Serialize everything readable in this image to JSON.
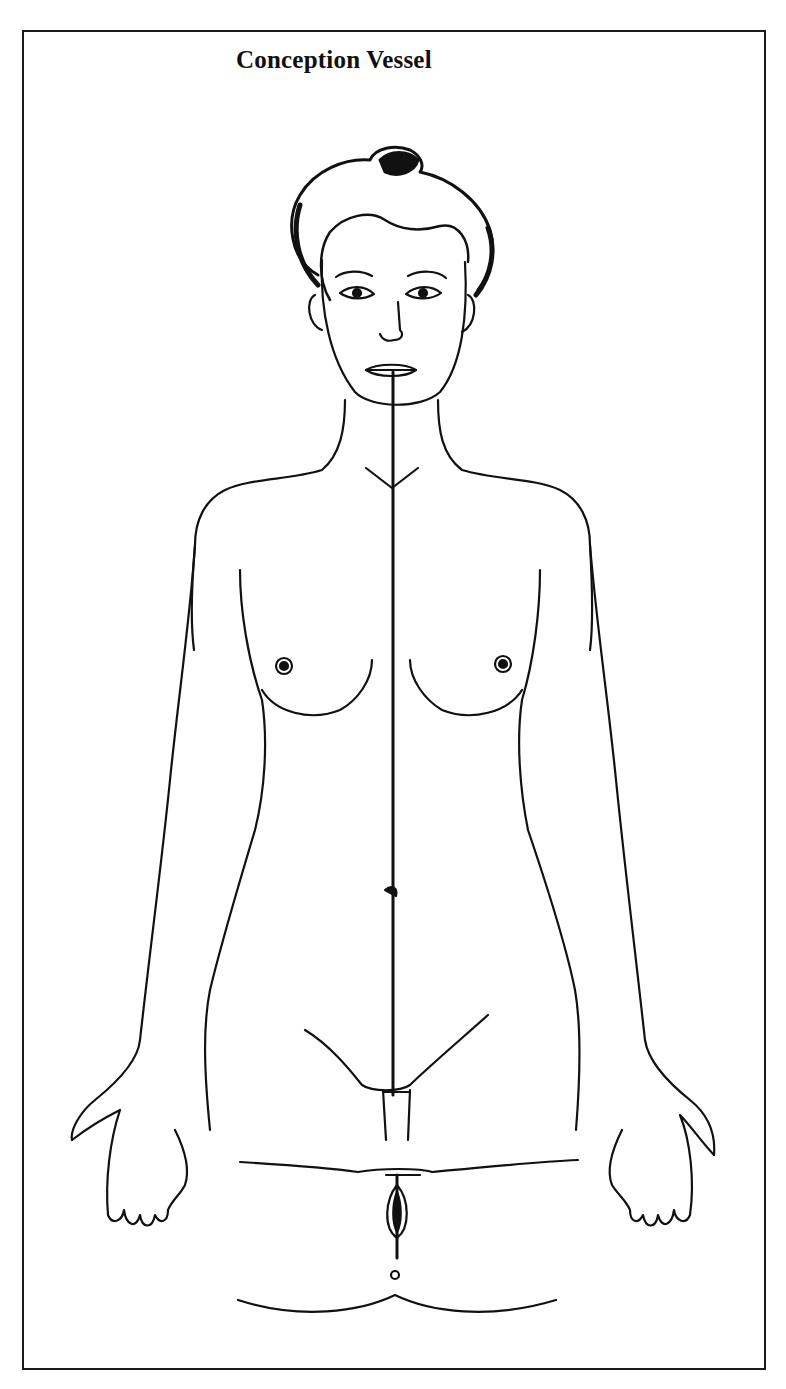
{
  "figure": {
    "title": "Conception Vessel",
    "meridian": {
      "name": "Conception Vessel",
      "path": "midline from lower lip to perineum",
      "stroke_color": "#111111"
    },
    "colors": {
      "background": "#ffffff",
      "line": "#111111",
      "frame": "#1a1a1a"
    }
  }
}
